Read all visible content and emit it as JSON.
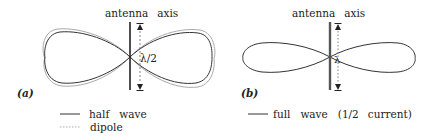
{
  "panel_a": {
    "label": "(a)",
    "axis_label_1": "antenna",
    "axis_label_2": "axis",
    "length_label": "λ/2",
    "legend": [
      {
        "style": "solid",
        "label_1": "half",
        "label_2": "wave"
      },
      {
        "style": "dotted",
        "label_1": "dipole",
        "label_2": ""
      }
    ]
  },
  "panel_b": {
    "label": "(b)",
    "axis_label_1": "antenna",
    "axis_label_2": "axis",
    "length_label": "λ",
    "legend": [
      {
        "style": "solid",
        "label_1": "full",
        "label_2": "wave",
        "label_3": "(1/2",
        "label_4": "current)"
      }
    ]
  },
  "colors": {
    "line": "#333333",
    "dotted": "#999999",
    "background": "#ffffff"
  }
}
